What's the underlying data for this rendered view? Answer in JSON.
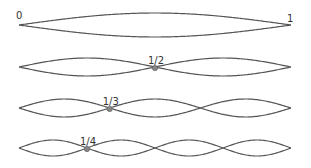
{
  "diagram": {
    "endpoint_labels": {
      "left": "0",
      "right": "1"
    },
    "modes": [
      {
        "harmonic": 1,
        "node_label": "",
        "loops": 1,
        "center_y": 25,
        "amplitude": 12
      },
      {
        "harmonic": 2,
        "node_label": "1/2",
        "loops": 2,
        "center_y": 67,
        "amplitude": 9
      },
      {
        "harmonic": 3,
        "node_label": "1/3",
        "loops": 3,
        "center_y": 108,
        "amplitude": 9
      },
      {
        "harmonic": 4,
        "node_label": "1/4",
        "loops": 4,
        "center_y": 148,
        "amplitude": 8
      }
    ],
    "x_start": 19,
    "x_end": 291,
    "colors": {
      "curve": "#555555",
      "node": "#888888",
      "text": "#333333"
    }
  }
}
